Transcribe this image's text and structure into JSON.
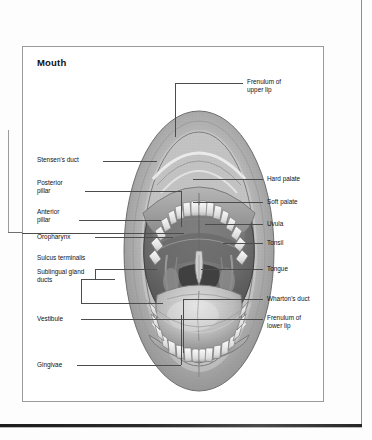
{
  "figure": {
    "title": "Mouth"
  },
  "labels_left": [
    {
      "id": "stensens-duct",
      "text": "Stensen's duct"
    },
    {
      "id": "posterior-pillar",
      "text": "Posterior\npillar"
    },
    {
      "id": "anterior-pillar",
      "text": "Anterior\npillar"
    },
    {
      "id": "oropharynx",
      "text": "Oropharynx"
    },
    {
      "id": "sulcus-terminalis",
      "text": "Sulcus terminalis"
    },
    {
      "id": "sublingual-gland-ducts",
      "text": "Sublingual gland\nducts"
    },
    {
      "id": "vestibule",
      "text": "Vestibule"
    },
    {
      "id": "gingivae",
      "text": "Gingivae"
    }
  ],
  "labels_right": [
    {
      "id": "frenulum-upper-lip",
      "text": "Frenulum of\nupper lip"
    },
    {
      "id": "hard-palate",
      "text": "Hard palate"
    },
    {
      "id": "soft-palate",
      "text": "Soft palate"
    },
    {
      "id": "uvula",
      "text": "Uvula"
    },
    {
      "id": "tonsil",
      "text": "Tonsil"
    },
    {
      "id": "tongue",
      "text": "Tongue"
    },
    {
      "id": "whartons-duct",
      "text": "Wharton's duct"
    },
    {
      "id": "frenulum-lower-lip",
      "text": "Frenulum of\nlower lip"
    }
  ],
  "colors": {
    "ink": "#111111",
    "leader": "#4c4c4c",
    "frame": "#9a9a9a",
    "page": "#ffffff",
    "scan_edge": "#1c1c1c",
    "art_mid": "#8d8d8d",
    "art_dark": "#4a4a4a",
    "art_light": "#d8d8d8",
    "cavity": "#6e6e6e"
  }
}
